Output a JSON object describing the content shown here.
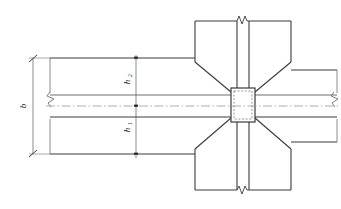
{
  "drawing": {
    "title": "Beam-Column Joint Detail",
    "type": "engineering-section-drawing",
    "colors": {
      "outline": "#3a3a3a",
      "outline_light": "#6e6e6e",
      "centerline": "#9a9a9a",
      "dimension": "#5a5a5a",
      "dashed_core": "#7a7a7a",
      "background": "#ffffff"
    },
    "labels": {
      "overall_depth": "b",
      "upper_haunch_depth": "h",
      "upper_haunch_sub": "2",
      "lower_haunch_depth": "h",
      "lower_haunch_sub": "1"
    },
    "annotations": {
      "overall_depth_full": "b",
      "upper_depth_full": "h2",
      "lower_depth_full": "h1"
    },
    "elements": {
      "left_beam": "left-beam-flange",
      "right_beam": "right-beam-flange",
      "top_column": "top-column",
      "bottom_column": "bottom-column",
      "joint_core": "joint-core-square",
      "centerline": "horizontal-centre-line",
      "break_top": "break-symbol-top",
      "break_bottom": "break-symbol-bottom",
      "break_left": "break-symbol-left",
      "break_right": "break-symbol-right"
    }
  }
}
